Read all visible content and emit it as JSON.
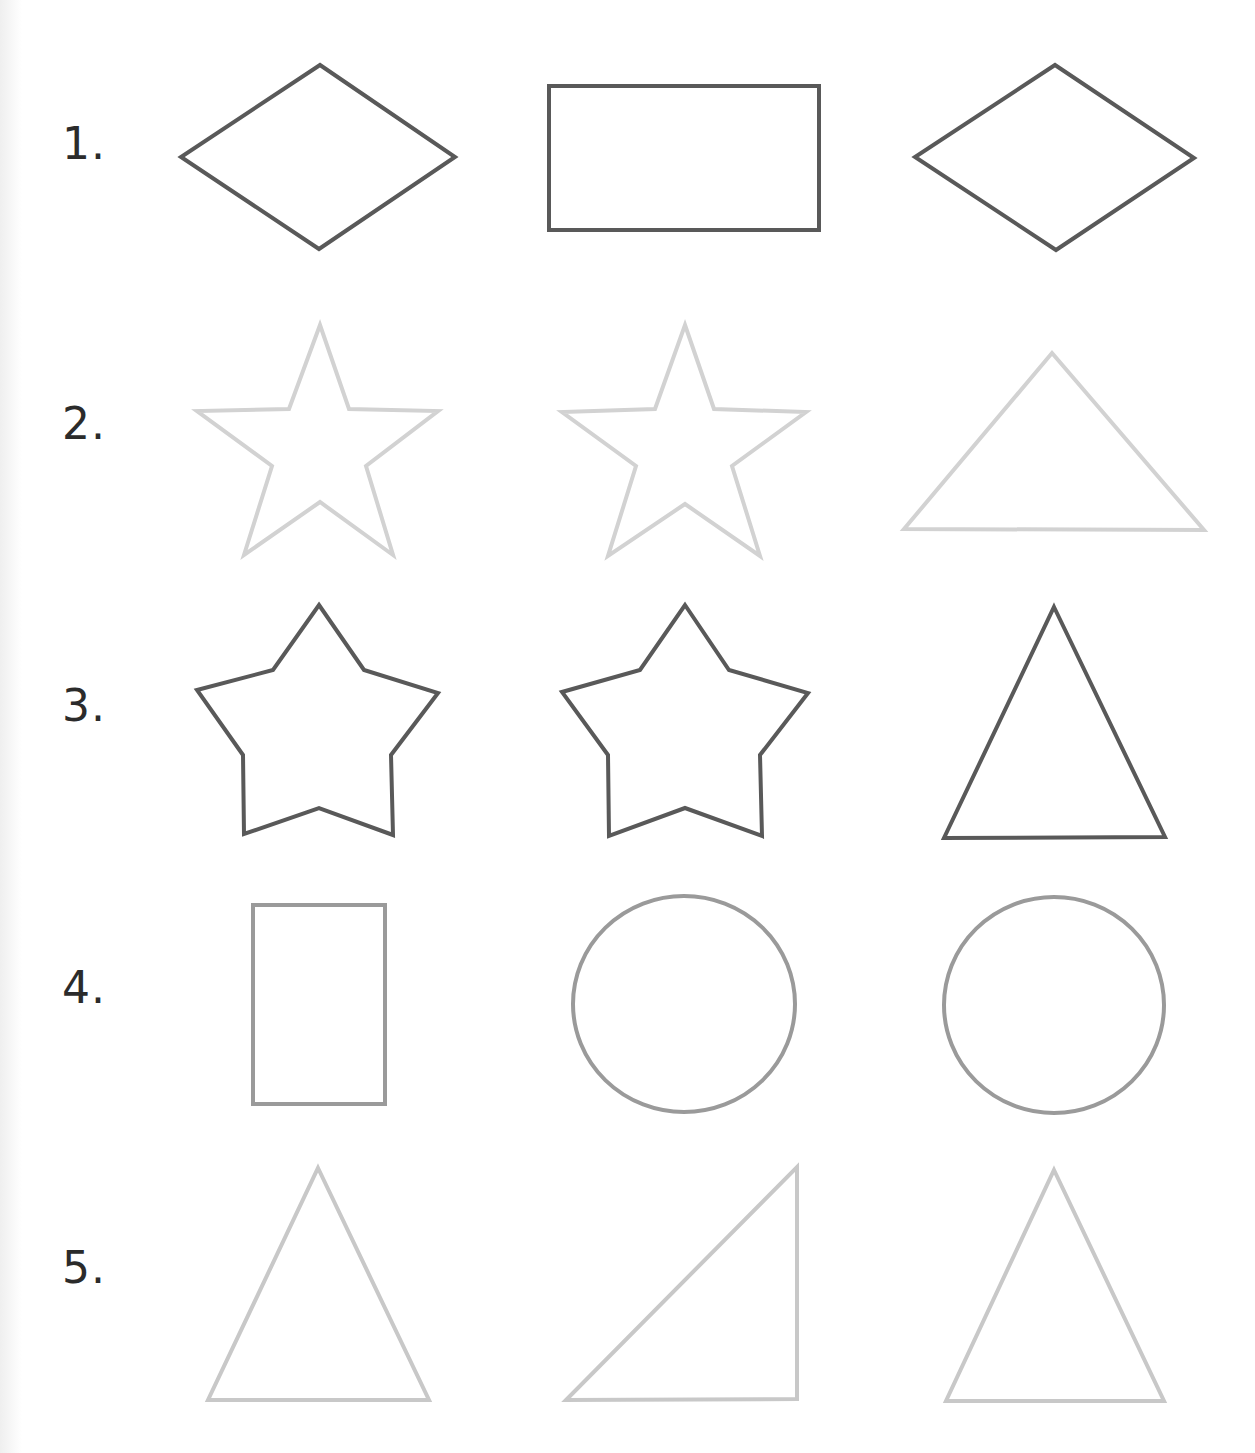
{
  "worksheet": {
    "rows": [
      {
        "label": "1.",
        "shapes": [
          "diamond",
          "rectangle",
          "diamond"
        ],
        "stroke": "#595959"
      },
      {
        "label": "2.",
        "shapes": [
          "star",
          "star",
          "triangle"
        ],
        "stroke": "#d2d2d2"
      },
      {
        "label": "3.",
        "shapes": [
          "rounded-star",
          "rounded-star",
          "triangle"
        ],
        "stroke": "#595959"
      },
      {
        "label": "4.",
        "shapes": [
          "rectangle",
          "circle",
          "circle"
        ],
        "stroke": "#9a9a9a"
      },
      {
        "label": "5.",
        "shapes": [
          "triangle",
          "right-triangle",
          "triangle"
        ],
        "stroke": "#c8c8c8"
      }
    ]
  }
}
